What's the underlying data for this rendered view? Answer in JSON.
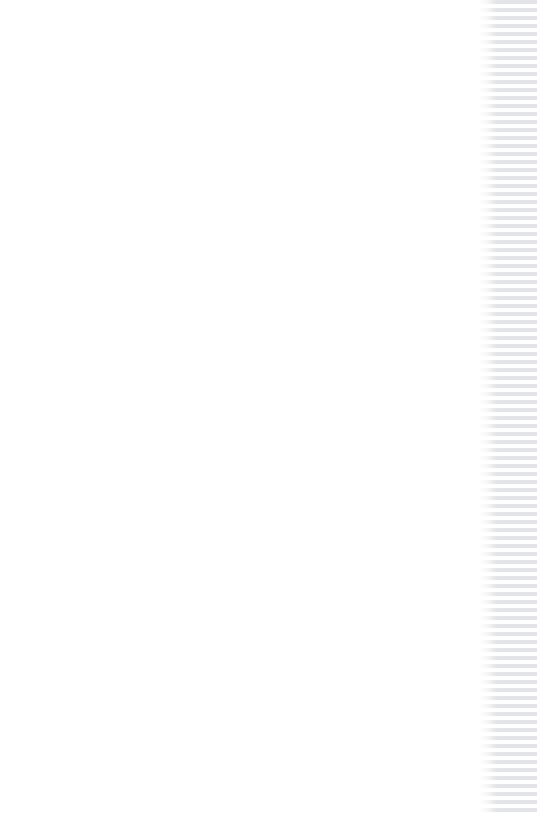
{
  "window": {
    "title": "Blank Document View",
    "width": 537,
    "height": 813,
    "background_color": "#ffffff"
  },
  "page": {
    "name": "document-page",
    "body_text": "",
    "is_blank": true,
    "background_color": "#ffffff",
    "text_color": "#000000"
  },
  "stripe_panel": {
    "name": "striped-edge-strip",
    "stripe_color": "#e2e4e7",
    "gap_color": "#ffffff",
    "stripe_height_px": 4,
    "gap_height_px": 4,
    "period_px": 8,
    "panel_width_px": 59,
    "orientation": "horizontal",
    "spans_full_height": true
  }
}
